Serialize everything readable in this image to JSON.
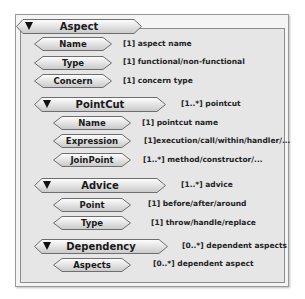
{
  "diagram": {
    "root": {
      "label": "Aspect",
      "collapse_icon": "triangle-down-icon",
      "attributes": [
        {
          "label": "Name",
          "desc": "[1] aspect name"
        },
        {
          "label": "Type",
          "desc": "[1] functional/non-functional"
        },
        {
          "label": "Concern",
          "desc": "[1] concern type"
        }
      ]
    },
    "groups": [
      {
        "label": "PointCut",
        "desc": "[1..*] pointcut",
        "collapse_icon": "triangle-down-icon",
        "attributes": [
          {
            "label": "Name",
            "desc": "[1] pointcut name"
          },
          {
            "label": "Expression",
            "desc": "[1]execution/call/within/handler/..."
          },
          {
            "label": "JoinPoint",
            "desc": "[1..*] method/constructor/..."
          }
        ]
      },
      {
        "label": "Advice",
        "desc": "[1..*] advice",
        "collapse_icon": "triangle-down-icon",
        "attributes": [
          {
            "label": "Point",
            "desc": "[1] before/after/around"
          },
          {
            "label": "Type",
            "desc": "[1] throw/handle/replace"
          }
        ]
      },
      {
        "label": "Dependency",
        "desc": "[0..*] dependent aspects",
        "collapse_icon": "triangle-down-icon",
        "attributes": [
          {
            "label": "Aspects",
            "desc": "[0..*] dependent aspect"
          }
        ]
      }
    ],
    "colors": {
      "node_fill_top": "#ffffff",
      "node_fill_bottom": "#cfcfcf",
      "node_stroke": "#6e6e6e",
      "panel": "#e6e6e6"
    }
  }
}
